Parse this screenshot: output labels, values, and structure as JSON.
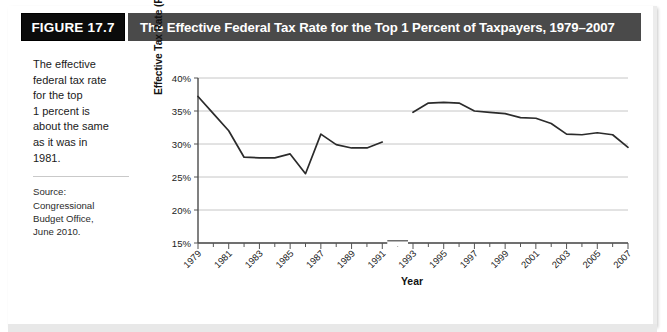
{
  "figure": {
    "tag": "FIGURE 17.7",
    "title": "The Effective Federal Tax Rate for the Top 1 Percent of Taxpayers, 1979–2007"
  },
  "caption": {
    "body": "The effective\nfederal tax rate\nfor the top\n1 percent is\nabout the same\nas it was in\n1981.",
    "source": "Source:\nCongressional\nBudget Office,\nJune 2010."
  },
  "chart_data": {
    "type": "line",
    "title": "The Effective Federal Tax Rate for the Top 1 Percent of Taxpayers, 1979–2007",
    "xlabel": "Year",
    "ylabel": "Effective Tax Rate (Percent)",
    "ylim": [
      15,
      40
    ],
    "ytick_values": [
      15,
      20,
      25,
      30,
      35,
      40
    ],
    "ytick_labels": [
      "15%",
      "20%",
      "25%",
      "30%",
      "35%",
      "40%"
    ],
    "xlim": [
      1979,
      2007
    ],
    "xtick_labels": [
      "1979",
      "1981",
      "1983",
      "1985",
      "1987",
      "1989",
      "1991",
      "1993",
      "1995",
      "1997",
      "1999",
      "2001",
      "2003",
      "2005",
      "2007"
    ],
    "xtick_values": [
      1979,
      1981,
      1983,
      1985,
      1987,
      1989,
      1991,
      1993,
      1995,
      1997,
      1999,
      2001,
      2003,
      2005,
      2007
    ],
    "minor_tick_values": [
      1980,
      1982,
      1984,
      1986,
      1988,
      1990,
      1992,
      1994,
      1996,
      1998,
      2000,
      2002,
      2004,
      2006
    ],
    "grid": "horizontal",
    "legend": null,
    "axis_break": {
      "after_year": 1991,
      "before_year": 1993,
      "note": "gap in plotted line between 1991 and 1993"
    },
    "line_color": "#2b2b2b",
    "grid_color": "#bfbfbf",
    "series": [
      {
        "name": "Effective federal tax rate, top 1 percent",
        "x": [
          1979,
          1980,
          1981,
          1982,
          1983,
          1984,
          1985,
          1986,
          1987,
          1988,
          1989,
          1990,
          1991
        ],
        "values": [
          37.2,
          34.6,
          32.0,
          28.0,
          27.9,
          27.9,
          28.5,
          25.5,
          31.5,
          29.9,
          29.4,
          29.4,
          30.3
        ]
      },
      {
        "name": "Effective federal tax rate, top 1 percent (continued)",
        "x": [
          1993,
          1994,
          1995,
          1996,
          1997,
          1998,
          1999,
          2000,
          2001,
          2002,
          2003,
          2004,
          2005,
          2006,
          2007
        ],
        "values": [
          34.8,
          36.2,
          36.3,
          36.2,
          35.0,
          34.8,
          34.6,
          34.0,
          33.9,
          33.1,
          31.5,
          31.4,
          31.7,
          31.4,
          29.5
        ]
      }
    ]
  }
}
